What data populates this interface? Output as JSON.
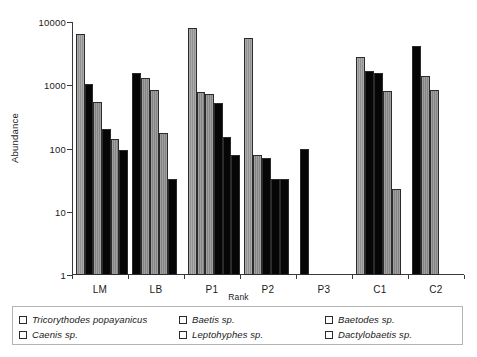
{
  "chart_data": {
    "type": "bar",
    "title": "",
    "xlabel": "Rank",
    "ylabel": "Abundance",
    "yscale": "log",
    "ylim": [
      1,
      10000
    ],
    "ytick_labels": [
      "10000",
      "1000",
      "100",
      "10",
      "1"
    ],
    "ytick_values": [
      10000,
      1000,
      100,
      10,
      1
    ],
    "grid": false,
    "legend_position": "bottom",
    "categories": [
      "LM",
      "LB",
      "P1",
      "P2",
      "P3",
      "C1",
      "C2"
    ],
    "series": [
      {
        "name": "Tricorythodes popayanicus",
        "swatch": "sw-gray"
      },
      {
        "name": "Baetis sp.",
        "swatch": "sw-dark"
      },
      {
        "name": "Baetodes sp.",
        "swatch": "sw-midgray"
      },
      {
        "name": "Caenis sp.",
        "swatch": "sw-black"
      },
      {
        "name": "Leptohyphes sp.",
        "swatch": "sw-midgray"
      },
      {
        "name": "Dactylobaetis sp.",
        "swatch": "sw-black"
      }
    ],
    "groups": [
      {
        "label": "LM",
        "bars": [
          {
            "value": 6500,
            "swatch": "sw-gray"
          },
          {
            "value": 1050,
            "swatch": "sw-black"
          },
          {
            "value": 550,
            "swatch": "sw-midgray"
          },
          {
            "value": 205,
            "swatch": "sw-black"
          },
          {
            "value": 140,
            "swatch": "sw-midgray"
          },
          {
            "value": 95,
            "swatch": "sw-black"
          }
        ]
      },
      {
        "label": "LB",
        "bars": [
          {
            "value": 1550,
            "swatch": "sw-black"
          },
          {
            "value": 1300,
            "swatch": "sw-midgray"
          },
          {
            "value": 840,
            "swatch": "sw-midgray"
          },
          {
            "value": 175,
            "swatch": "sw-midgray"
          },
          {
            "value": 33,
            "swatch": "sw-black"
          }
        ]
      },
      {
        "label": "P1",
        "bars": [
          {
            "value": 8000,
            "swatch": "sw-gray"
          },
          {
            "value": 780,
            "swatch": "sw-midgray"
          },
          {
            "value": 740,
            "swatch": "sw-midgray"
          },
          {
            "value": 520,
            "swatch": "sw-black"
          },
          {
            "value": 150,
            "swatch": "sw-black"
          },
          {
            "value": 78,
            "swatch": "sw-black"
          }
        ]
      },
      {
        "label": "P2",
        "bars": [
          {
            "value": 5500,
            "swatch": "sw-gray"
          },
          {
            "value": 80,
            "swatch": "sw-midgray"
          },
          {
            "value": 70,
            "swatch": "sw-black"
          },
          {
            "value": 33,
            "swatch": "sw-black"
          },
          {
            "value": 33,
            "swatch": "sw-black"
          }
        ]
      },
      {
        "label": "P3",
        "bars": [
          {
            "value": 100,
            "swatch": "sw-black"
          }
        ]
      },
      {
        "label": "C1",
        "bars": [
          {
            "value": 2800,
            "swatch": "sw-gray"
          },
          {
            "value": 1700,
            "swatch": "sw-black"
          },
          {
            "value": 1550,
            "swatch": "sw-black"
          },
          {
            "value": 800,
            "swatch": "sw-midgray"
          },
          {
            "value": 23,
            "swatch": "sw-midgray"
          }
        ]
      },
      {
        "label": "C2",
        "bars": [
          {
            "value": 4200,
            "swatch": "sw-black"
          },
          {
            "value": 1400,
            "swatch": "sw-midgray"
          },
          {
            "value": 850,
            "swatch": "sw-midgray"
          }
        ]
      }
    ]
  }
}
